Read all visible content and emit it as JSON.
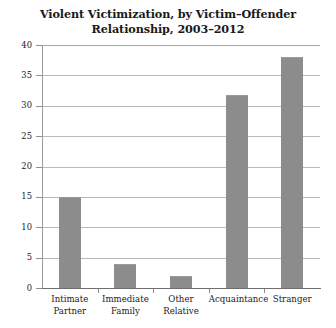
{
  "chart_data": {
    "type": "bar",
    "title": "Violent Victimization, by Victim–Offender Relationship, 2003–2012",
    "title_lines": [
      "Violent Victimization, by Victim–Offender",
      "Relationship, 2003–2012"
    ],
    "categories": [
      "Intimate Partner",
      "Immediate Family",
      "Other Relative",
      "Acquaintance",
      "Stranger"
    ],
    "category_lines": [
      [
        "Intimate",
        "Partner"
      ],
      [
        "Immediate",
        "Family"
      ],
      [
        "Other",
        "Relative"
      ],
      [
        "Acquaintance"
      ],
      [
        "Stranger"
      ]
    ],
    "values": [
      15,
      4,
      2,
      31.7,
      38
    ],
    "xlabel": "",
    "ylabel": "",
    "ylim": [
      0,
      40
    ],
    "ytick_labels": [
      "40",
      "35",
      "30",
      "25",
      "20",
      "15",
      "10",
      "5",
      "0"
    ],
    "ytick_values": [
      40,
      35,
      30,
      25,
      20,
      15,
      10,
      5,
      0
    ],
    "grid": "horizontal",
    "legend": "none",
    "bar_color": "#8c8c8c",
    "grid_color": "#b9b9b9",
    "axis_color": "#6f6f6f",
    "background_color": "#ffffff"
  }
}
